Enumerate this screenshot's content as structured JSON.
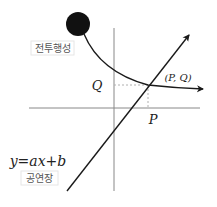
{
  "diagram": {
    "planet_label": "전투행성",
    "venue_label": "공연장",
    "equation": "y=ax+b",
    "point_label": "(P, Q)",
    "x_label": "P",
    "y_label": "Q",
    "colors": {
      "ink": "#1a1a1a",
      "axis": "#888888",
      "dash": "#b0b0b0",
      "label_box": "#e6e6e6"
    }
  }
}
